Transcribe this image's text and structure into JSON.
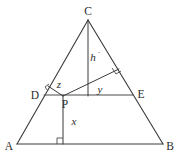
{
  "diagram": {
    "stroke_color": "#3a3a3a",
    "background_color": "#ffffff",
    "vertices": [
      {
        "name": "C",
        "label": "C",
        "x": 88,
        "y": 20,
        "label_x": 88,
        "label_y": 11
      },
      {
        "name": "A",
        "label": "A",
        "x": 17,
        "y": 144,
        "label_x": 9,
        "label_y": 149
      },
      {
        "name": "B",
        "label": "B",
        "x": 163,
        "y": 144,
        "label_x": 169,
        "label_y": 149
      },
      {
        "name": "D",
        "label": "D",
        "x": 44,
        "y": 95,
        "label_x": 35,
        "label_y": 98
      },
      {
        "name": "E",
        "label": "E",
        "x": 133,
        "y": 95,
        "label_x": 140,
        "label_y": 97
      },
      {
        "name": "P",
        "label": "P",
        "x": 63,
        "y": 95,
        "label_x": 64,
        "label_y": 107
      }
    ],
    "measures": [
      {
        "name": "h",
        "label": "h",
        "superscript": "·",
        "x": 93,
        "y": 60
      },
      {
        "name": "y",
        "label": "y",
        "x": 100,
        "y": 93
      },
      {
        "name": "z",
        "label": "z",
        "x": 59,
        "y": 87
      },
      {
        "name": "x",
        "label": "x",
        "x": 74,
        "y": 124
      }
    ],
    "edges": [
      {
        "name": "side-AC",
        "from": "A",
        "to": "C"
      },
      {
        "name": "side-CB",
        "from": "C",
        "to": "B"
      },
      {
        "name": "side-AB",
        "from": "A",
        "to": "B"
      },
      {
        "name": "segment-DE",
        "from": "D",
        "to": "E"
      },
      {
        "name": "altitude-C-to-DE",
        "from": "C",
        "to": "F"
      },
      {
        "name": "perpendicular-P-to-AB",
        "from": "P",
        "to": "G"
      },
      {
        "name": "perpendicular-P-to-CB",
        "from": "P",
        "to": "H"
      },
      {
        "name": "perpendicular-P-to-AC",
        "from": "P",
        "to": "I"
      }
    ],
    "right_angles": [
      {
        "name": "right-angle-at-AB",
        "at_x": 63,
        "at_y": 144
      },
      {
        "name": "right-angle-at-CB",
        "at_x": 118,
        "at_y": 70
      },
      {
        "name": "right-angle-at-AC",
        "at_x": 48,
        "at_y": 88
      }
    ]
  }
}
